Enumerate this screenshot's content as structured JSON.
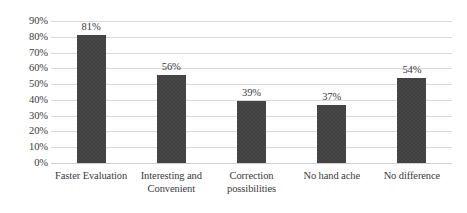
{
  "chart_data": {
    "type": "bar",
    "title": "",
    "subtitle": "",
    "xlabel": "",
    "ylabel": "",
    "categories": [
      "Faster Evaluation",
      "Interesting and Convenient",
      "Correction possibilities",
      "No hand ache",
      "No difference"
    ],
    "values": [
      81,
      56,
      39,
      37,
      54
    ],
    "value_labels": [
      "81%",
      "56%",
      "39%",
      "37%",
      "54%"
    ],
    "ylim": [
      0,
      90
    ],
    "ytick_labels": [
      "90%",
      "80%",
      "70%",
      "60%",
      "50%",
      "40%",
      "30%",
      "20%",
      "10%",
      "0%"
    ],
    "ytick_values": [
      90,
      80,
      70,
      60,
      50,
      40,
      30,
      20,
      10,
      0
    ],
    "grid": "horizontal",
    "legend": "none",
    "series_color": "#404040",
    "gridline_color": "#d9d9d9",
    "background_color": "#ffffff"
  },
  "category_lines": [
    [
      "Faster Evaluation"
    ],
    [
      "Interesting and",
      "Convenient"
    ],
    [
      "Correction",
      "possibilities"
    ],
    [
      "No hand ache"
    ],
    [
      "No difference"
    ]
  ]
}
